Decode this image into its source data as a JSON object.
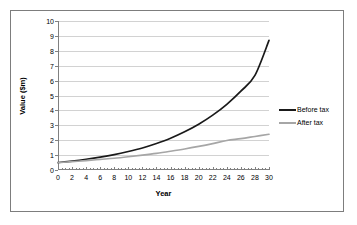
{
  "chart_data": {
    "type": "line",
    "title": "",
    "xlabel": "Year",
    "ylabel": "Value ($m)",
    "xlim": [
      0,
      30
    ],
    "ylim": [
      0,
      10
    ],
    "xticks": [
      0,
      2,
      4,
      6,
      8,
      10,
      12,
      14,
      16,
      18,
      20,
      22,
      24,
      26,
      28,
      30
    ],
    "yticks": [
      0,
      1,
      2,
      3,
      4,
      5,
      6,
      7,
      8,
      9,
      10
    ],
    "grid": "horizontal",
    "legend_position": "right",
    "x": [
      0,
      2,
      4,
      6,
      8,
      10,
      12,
      14,
      16,
      18,
      20,
      22,
      24,
      26,
      28,
      30
    ],
    "series": [
      {
        "name": "Before tax",
        "color": "#1a1a1a",
        "values": [
          0.5,
          0.6,
          0.72,
          0.86,
          1.03,
          1.24,
          1.48,
          1.78,
          2.13,
          2.56,
          3.07,
          3.68,
          4.41,
          5.29,
          6.35,
          8.7
        ]
      },
      {
        "name": "After tax",
        "color": "#a6a6a6",
        "values": [
          0.5,
          0.56,
          0.63,
          0.71,
          0.79,
          0.89,
          1.0,
          1.12,
          1.26,
          1.41,
          1.58,
          1.77,
          1.98,
          2.1,
          2.25,
          2.4
        ]
      }
    ]
  },
  "axes": {
    "ylabel": "Value ($m)",
    "xlabel": "Year"
  },
  "legend": {
    "items": [
      {
        "label": "Before tax",
        "color": "#1a1a1a"
      },
      {
        "label": "After tax",
        "color": "#a6a6a6"
      }
    ]
  }
}
